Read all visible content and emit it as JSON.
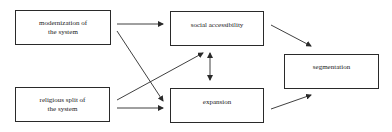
{
  "diagram": {
    "type": "flow-diagram",
    "nodes": [
      {
        "id": "modernization",
        "label": "modernization of\nthe system"
      },
      {
        "id": "religious",
        "label": "religious split of\nthe system"
      },
      {
        "id": "social",
        "label": "social accessibility"
      },
      {
        "id": "expansion",
        "label": "expansion"
      },
      {
        "id": "segmentation",
        "label": "segmentation"
      }
    ],
    "edges": [
      {
        "from": "modernization",
        "to": "social",
        "direction": "forward"
      },
      {
        "from": "modernization",
        "to": "expansion",
        "direction": "forward"
      },
      {
        "from": "religious",
        "to": "social",
        "direction": "forward"
      },
      {
        "from": "religious",
        "to": "expansion",
        "direction": "forward"
      },
      {
        "from": "social",
        "to": "expansion",
        "direction": "bidirectional"
      },
      {
        "from": "social",
        "to": "segmentation",
        "direction": "forward"
      },
      {
        "from": "expansion",
        "to": "segmentation",
        "direction": "forward"
      }
    ],
    "colors": {
      "line": "#2a2a2a",
      "background": "#ffffff"
    }
  }
}
